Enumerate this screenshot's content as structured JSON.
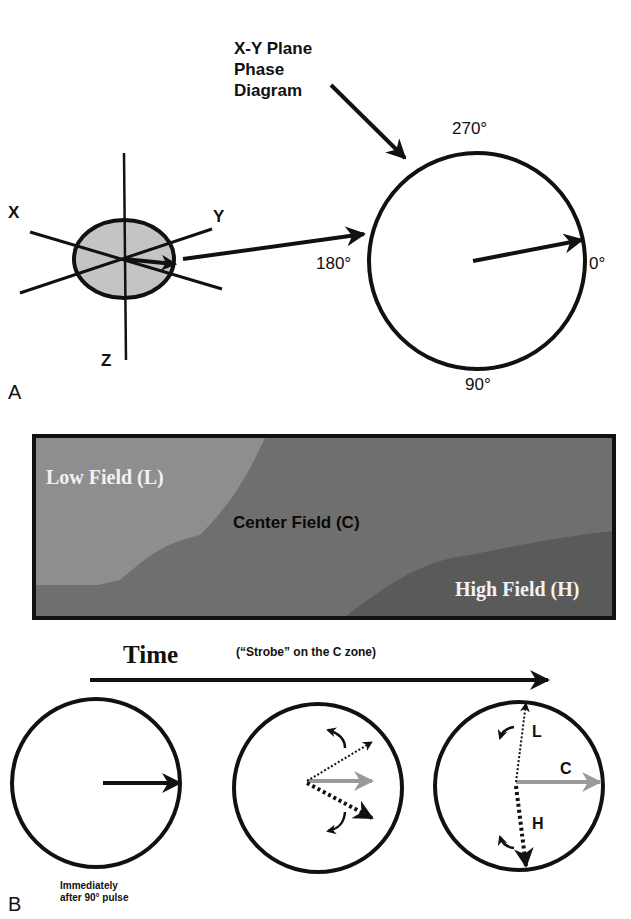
{
  "panel_a": {
    "letter": "A",
    "axes": {
      "x": "X",
      "y": "Y",
      "z": "Z"
    },
    "callout": [
      "X-Y Plane",
      "Phase",
      "Diagram"
    ],
    "phase_circle": {
      "angle_top": "270°",
      "angle_right": "0°",
      "angle_bottom": "90°",
      "angle_left": "180°"
    }
  },
  "panel_b": {
    "letter": "B",
    "field_map": {
      "low": "Low Field (L)",
      "center": "Center Field (C)",
      "high": "High Field (H)",
      "colors": {
        "low": "#8e8e8e",
        "center": "#6f6f6f",
        "high": "#5a5a5a",
        "border": "#111111"
      }
    },
    "time_label": "Time",
    "strobe_note": "(“Strobe” on the C zone)",
    "caption": [
      "Immediately",
      "after 90° pulse"
    ],
    "vector_labels": {
      "low": "L",
      "center": "C",
      "high": "H"
    },
    "colors": {
      "center_vector": "#9a9a9a",
      "line": "#111111"
    }
  }
}
